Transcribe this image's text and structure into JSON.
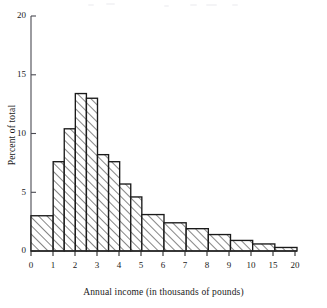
{
  "chart_data": {
    "type": "bar",
    "title": "",
    "subtitle": "",
    "xlabel": "Annual income (in thousands of pounds)",
    "ylabel": "Percent of total",
    "grid": false,
    "legend": null,
    "legend_position": "none",
    "xlim": [
      0,
      20
    ],
    "ylim": [
      0,
      20
    ],
    "x_tick_labels": [
      "0",
      "1",
      "2",
      "3",
      "4",
      "5",
      "6",
      "7",
      "8",
      "9",
      "10",
      "15",
      "20"
    ],
    "x_tick_values": [
      0,
      1,
      2,
      3,
      4,
      5,
      6,
      7,
      8,
      9,
      10,
      15,
      20
    ],
    "x_axis_note": "x axis is broken: equal spacing per unit from 0 to 10, then one equal-width slot for 10-15 and one for 15-20",
    "y_tick_labels": [
      "0",
      "5",
      "10",
      "15",
      "20"
    ],
    "y_tick_values": [
      0,
      5,
      10,
      15,
      20
    ],
    "categories": [
      "0-1",
      "1-1.5",
      "1.5-2",
      "2-2.5",
      "2.5-3",
      "3-3.5",
      "3.5-4",
      "4-4.5",
      "4.5-5",
      "5-6",
      "6-7",
      "7-8",
      "8-9",
      "9-10",
      "10-15",
      "15-20"
    ],
    "values": [
      3.0,
      7.6,
      10.4,
      13.4,
      13.0,
      8.2,
      7.6,
      5.7,
      4.6,
      3.1,
      2.4,
      1.9,
      1.4,
      0.9,
      0.6,
      0.3
    ],
    "bars": [
      {
        "label": "0-1",
        "x0": 0,
        "x1": 1,
        "height": 3.0
      },
      {
        "label": "1-1.5",
        "x0": 1,
        "x1": 1.5,
        "height": 7.6
      },
      {
        "label": "1.5-2",
        "x0": 1.5,
        "x1": 2,
        "height": 10.4
      },
      {
        "label": "2-2.5",
        "x0": 2,
        "x1": 2.5,
        "height": 13.4
      },
      {
        "label": "2.5-3",
        "x0": 2.5,
        "x1": 3,
        "height": 13.0
      },
      {
        "label": "3-3.5",
        "x0": 3,
        "x1": 3.5,
        "height": 8.2
      },
      {
        "label": "3.5-4",
        "x0": 3.5,
        "x1": 4,
        "height": 7.6
      },
      {
        "label": "4-4.5",
        "x0": 4,
        "x1": 4.5,
        "height": 5.7
      },
      {
        "label": "4.5-5",
        "x0": 4.5,
        "x1": 5,
        "height": 4.6
      },
      {
        "label": "5-6",
        "x0": 5,
        "x1": 6,
        "height": 3.1
      },
      {
        "label": "6-7",
        "x0": 6,
        "x1": 7,
        "height": 2.4
      },
      {
        "label": "7-8",
        "x0": 7,
        "x1": 8,
        "height": 1.9
      },
      {
        "label": "8-9",
        "x0": 8,
        "x1": 9,
        "height": 1.4
      },
      {
        "label": "9-10",
        "x0": 9,
        "x1": 10,
        "height": 0.9
      },
      {
        "label": "10-15",
        "x0": 10,
        "x1": 15,
        "height": 0.6
      },
      {
        "label": "15-20",
        "x0": 15,
        "x1": 20,
        "height": 0.3
      }
    ],
    "style": {
      "bar_fill": "hatch-45-forward",
      "bar_edge_color": "#1a1a1a",
      "axis_color": "#4a4a52",
      "background": "#ffffff"
    }
  }
}
